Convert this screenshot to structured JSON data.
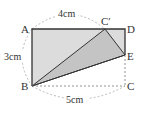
{
  "diagram": {
    "type": "folded-rectangle geometry figure",
    "points": {
      "A": "A",
      "D": "D",
      "C_prime": "C′",
      "E": "E",
      "B": "B",
      "C": "C"
    },
    "dimensions": {
      "top": "4cm",
      "left": "3cm",
      "bottom": "5cm"
    },
    "colors": {
      "rect_fill": "#dcdcdc",
      "triangle_fill": "#c4c4c4",
      "stroke": "#333333",
      "dashed": "#999999"
    }
  }
}
